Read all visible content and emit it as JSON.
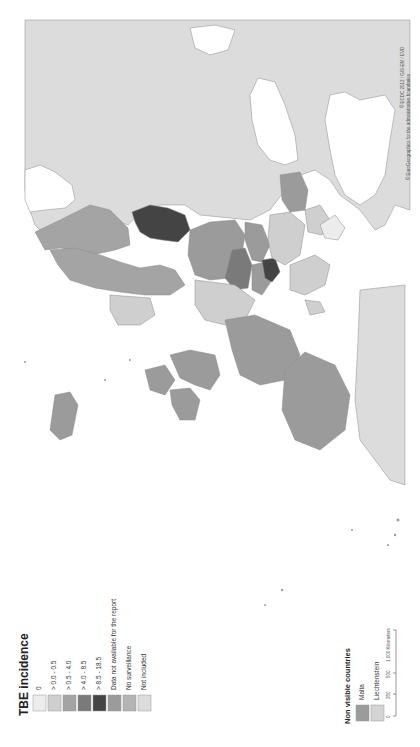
{
  "legend": {
    "title": "TBE incidence",
    "items": [
      {
        "label": "0",
        "color": "#ececec"
      },
      {
        "label": "> 0.0 - 0.5",
        "color": "#cfcfcf"
      },
      {
        "label": "> 0.5 - 4.0",
        "color": "#a4a4a4"
      },
      {
        "label": "> 4.0 - 8.5",
        "color": "#7a7a7a"
      },
      {
        "label": "> 8.5 - 18.5",
        "color": "#444444"
      },
      {
        "label": "Data not available for the report",
        "color": "#9b9b9b"
      },
      {
        "label": "No surveillance",
        "color": "#b3b3b3"
      },
      {
        "label": "Not included",
        "color": "#dcdcdc"
      }
    ]
  },
  "non_visible": {
    "title": "Non visible countries",
    "items": [
      {
        "label": "Malta",
        "color": "#9b9b9b"
      },
      {
        "label": "Liechtenstein",
        "color": "#d4d4d4"
      }
    ]
  },
  "scale_bar": {
    "ticks": [
      "0",
      "250",
      "500",
      "1,000 Kilometers"
    ]
  },
  "credits": {
    "line1": "© ECDC 2012 / GIS-EM / EVD",
    "line2": "© EuroGeographics for the administrative boundaries"
  },
  "colors": {
    "not_included": "#dcdcdc",
    "water": "#ffffff",
    "border": "#8a8a8a"
  }
}
